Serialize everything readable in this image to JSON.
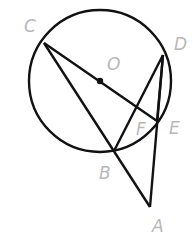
{
  "diagram": {
    "type": "geometry",
    "circle": {
      "center": "O",
      "cx": 100,
      "cy": 81,
      "r": 71
    },
    "points": {
      "O": {
        "x": 100,
        "y": 81
      },
      "C": {
        "x": 44,
        "y": 43
      },
      "D": {
        "x": 163,
        "y": 55
      },
      "E": {
        "x": 157,
        "y": 121
      },
      "F": {
        "x": 138,
        "y": 113
      },
      "B": {
        "x": 114,
        "y": 151
      },
      "A": {
        "x": 150,
        "y": 207
      }
    },
    "segments": [
      [
        "C",
        "E"
      ],
      [
        "C",
        "A"
      ],
      [
        "B",
        "D"
      ],
      [
        "D",
        "E"
      ],
      [
        "D",
        "A"
      ]
    ],
    "labels": {
      "C": "C",
      "D": "D",
      "O": "O",
      "F": "F",
      "E": "E",
      "B": "B",
      "A": "A"
    },
    "colors": {
      "stroke": "#111111",
      "label": "#b8b8b8"
    }
  }
}
